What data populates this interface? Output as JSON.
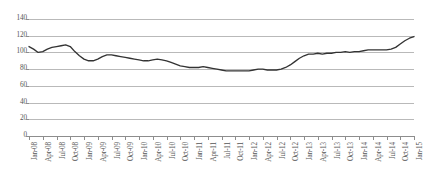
{
  "chart_data": {
    "type": "line",
    "title": "",
    "subtitle": "",
    "xlabel": "",
    "ylabel": "",
    "ylim": [
      0,
      140
    ],
    "ytick_step": 20,
    "yticks": [
      0,
      20,
      40,
      60,
      80,
      100,
      120,
      140
    ],
    "grid": true,
    "legend": false,
    "legend_position": "none",
    "line_color": "#333333",
    "gridline_color": "#b9b9b9",
    "axis_color": "#8d8d8d",
    "background_color": "#ffffff",
    "tick_labels": [
      "Jan-08",
      "Apr-08",
      "Jul-08",
      "Oct-08",
      "Jan-09",
      "Apr-09",
      "Jul-09",
      "Oct-09",
      "Jan-10",
      "Apr-10",
      "Jul-10",
      "Oct-10",
      "Jan-11",
      "Apr-11",
      "Jul-11",
      "Oct-11",
      "Jan-12",
      "Apr-12",
      "Jul-12",
      "Oct-12",
      "Jan-13",
      "Apr-13",
      "Jul-13",
      "Oct-13",
      "Jan-14",
      "Apr-14",
      "Jul-14",
      "Oct-14",
      "Jan-15"
    ],
    "x": [
      "Jan-08",
      "Feb-08",
      "Mar-08",
      "Apr-08",
      "May-08",
      "Jun-08",
      "Jul-08",
      "Aug-08",
      "Sep-08",
      "Oct-08",
      "Nov-08",
      "Dec-08",
      "Jan-09",
      "Feb-09",
      "Mar-09",
      "Apr-09",
      "May-09",
      "Jun-09",
      "Jul-09",
      "Aug-09",
      "Sep-09",
      "Oct-09",
      "Nov-09",
      "Dec-09",
      "Jan-10",
      "Feb-10",
      "Mar-10",
      "Apr-10",
      "May-10",
      "Jun-10",
      "Jul-10",
      "Aug-10",
      "Sep-10",
      "Oct-10",
      "Nov-10",
      "Dec-10",
      "Jan-11",
      "Feb-11",
      "Mar-11",
      "Apr-11",
      "May-11",
      "Jun-11",
      "Jul-11",
      "Aug-11",
      "Sep-11",
      "Oct-11",
      "Nov-11",
      "Dec-11",
      "Jan-12",
      "Feb-12",
      "Mar-12",
      "Apr-12",
      "May-12",
      "Jun-12",
      "Jul-12",
      "Aug-12",
      "Sep-12",
      "Oct-12",
      "Nov-12",
      "Dec-12",
      "Jan-13",
      "Feb-13",
      "Mar-13",
      "Apr-13",
      "May-13",
      "Jun-13",
      "Jul-13",
      "Aug-13",
      "Sep-13",
      "Oct-13",
      "Nov-13",
      "Dec-13",
      "Jan-14",
      "Feb-14",
      "Mar-14",
      "Apr-14",
      "May-14",
      "Jun-14",
      "Jul-14",
      "Aug-14",
      "Sep-14",
      "Oct-14",
      "Nov-14",
      "Dec-14",
      "Jan-15"
    ],
    "values": [
      107,
      104,
      100,
      101,
      104,
      106,
      107,
      108,
      109,
      107,
      101,
      96,
      92,
      90,
      90,
      92,
      95,
      97,
      97,
      96,
      95,
      94,
      93,
      92,
      91,
      90,
      90,
      91,
      92,
      91,
      90,
      88,
      86,
      84,
      83,
      82,
      82,
      82,
      83,
      82,
      81,
      80,
      79,
      78,
      78,
      78,
      78,
      78,
      78,
      79,
      80,
      80,
      79,
      79,
      79,
      80,
      82,
      85,
      89,
      93,
      96,
      98,
      98,
      99,
      98,
      99,
      99,
      100,
      100,
      101,
      100,
      101,
      101,
      102,
      103,
      103,
      103,
      103,
      103,
      104,
      106,
      110,
      114,
      117,
      119
    ]
  }
}
